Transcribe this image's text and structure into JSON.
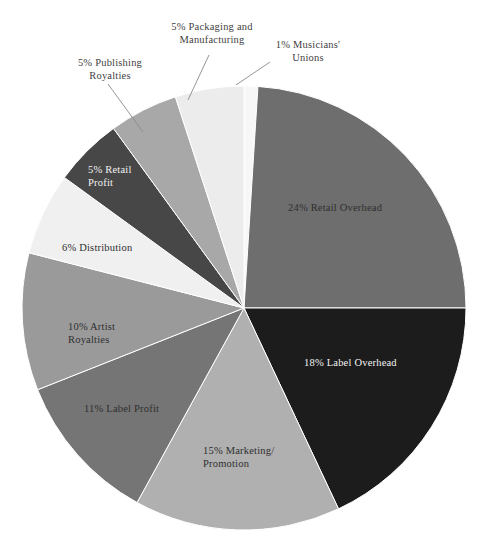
{
  "chart_data": {
    "type": "pie",
    "title": "",
    "subtitle": "",
    "xlabel": "",
    "ylabel": "",
    "legend_position": "none",
    "grid": false,
    "units": "percent",
    "total": 100,
    "start_angle_deg": 0,
    "direction": "clockwise",
    "center": {
      "x": 244,
      "y": 308
    },
    "radius": 222,
    "slices": [
      {
        "label": "Musicians' Unions",
        "value": 1,
        "display": "1% Musicians'\nUnions",
        "color": "#f7f7f7",
        "label_placement": "outside",
        "text_color": "#3f3f3f"
      },
      {
        "label": "Retail Overhead",
        "value": 24,
        "display": "24% Retail Overhead",
        "color": "#6e6e6e",
        "label_placement": "inside",
        "text_color": "#2f2f2f"
      },
      {
        "label": "Label Overhead",
        "value": 18,
        "display": "18% Label Overhead",
        "color": "#1c1c1c",
        "label_placement": "inside",
        "text_color": "#f2f2f2"
      },
      {
        "label": "Marketing/Promotion",
        "value": 15,
        "display": "15% Marketing/\nPromotion",
        "color": "#b0b0b0",
        "label_placement": "inside",
        "text_color": "#2f2f2f"
      },
      {
        "label": "Label Profit",
        "value": 11,
        "display": "11% Label Profit",
        "color": "#757575",
        "label_placement": "inside",
        "text_color": "#2f2f2f"
      },
      {
        "label": "Artist Royalties",
        "value": 10,
        "display": "10% Artist\nRoyalties",
        "color": "#9a9a9a",
        "label_placement": "inside",
        "text_color": "#2f2f2f"
      },
      {
        "label": "Distribution",
        "value": 6,
        "display": "6% Distribution",
        "color": "#f0f0f0",
        "label_placement": "inside",
        "text_color": "#2f2f2f"
      },
      {
        "label": "Retail Profit",
        "value": 5,
        "display": "5% Retail\nProfit",
        "color": "#474747",
        "label_placement": "inside",
        "text_color": "#f2f2f2"
      },
      {
        "label": "Publishing Royalties",
        "value": 5,
        "display": "5% Publishing\nRoyalties",
        "color": "#a8a8a8",
        "label_placement": "outside",
        "text_color": "#3f3f3f"
      },
      {
        "label": "Packaging and Manufacturing",
        "value": 5,
        "display": "5% Packaging and\nManufacturing",
        "color": "#ececec",
        "label_placement": "outside",
        "text_color": "#3f3f3f"
      }
    ],
    "leader_lines": [
      {
        "for": "Publishing Royalties",
        "x1": 108,
        "y1": 84,
        "x2": 143,
        "y2": 132
      },
      {
        "for": "Packaging and Manufacturing",
        "x1": 209,
        "y1": 55,
        "x2": 188,
        "y2": 100
      },
      {
        "for": "Musicians' Unions",
        "x1": 270,
        "y1": 62,
        "x2": 236,
        "y2": 85
      }
    ]
  }
}
